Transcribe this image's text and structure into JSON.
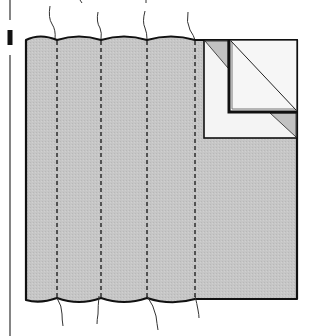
{
  "figure": {
    "colors": {
      "background": "#ffffff",
      "fabric": "#c4c4c4",
      "fabric_light": "#f4f4f4",
      "outline": "#111111",
      "seam": "#222222"
    },
    "panel": {
      "left": 26,
      "right": 297,
      "top": 40,
      "bottom": 299
    },
    "seams_x": [
      57,
      101,
      147,
      195
    ],
    "threads_top": [
      {
        "x1": 51,
        "y1": 8,
        "x2": 55,
        "y2": 38
      },
      {
        "x1": 99,
        "y1": 14,
        "x2": 101,
        "y2": 38
      },
      {
        "x1": 145,
        "y1": 12,
        "x2": 147,
        "y2": 38
      },
      {
        "x1": 188,
        "y1": 13,
        "x2": 195,
        "y2": 40
      }
    ],
    "threads_bottom": [
      {
        "x1": 57,
        "y1": 298,
        "x2": 63,
        "y2": 326
      },
      {
        "x1": 99,
        "y1": 296,
        "x2": 97,
        "y2": 324
      },
      {
        "x1": 147,
        "y1": 296,
        "x2": 158,
        "y2": 330
      },
      {
        "x1": 195,
        "y1": 296,
        "x2": 199,
        "y2": 318
      }
    ],
    "corner": {
      "outer": {
        "x": 204,
        "y": 40,
        "w": 93,
        "h": 98
      },
      "inner": {
        "x": 229,
        "y": 40,
        "w": 68,
        "h": 72
      }
    },
    "left_rule": {
      "x": 10,
      "segments": [
        [
          0,
          20
        ],
        [
          30,
          45
        ],
        [
          55,
          336
        ]
      ],
      "thick_segment_index": 1
    }
  }
}
